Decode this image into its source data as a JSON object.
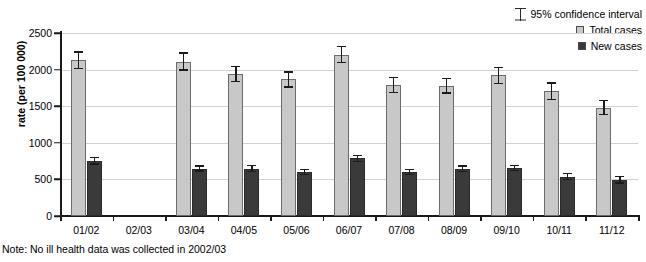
{
  "chart_data": {
    "type": "bar",
    "title": "",
    "xlabel": "",
    "ylabel": "rate (per 100 000)",
    "ylim": [
      0,
      2500
    ],
    "yticks": [
      0,
      500,
      1000,
      1500,
      2000,
      2500
    ],
    "grid": true,
    "legend_position": "top-right",
    "categories": [
      "01/02",
      "02/03",
      "03/04",
      "04/05",
      "05/06",
      "06/07",
      "07/08",
      "08/09",
      "09/10",
      "10/11",
      "11/12"
    ],
    "series": [
      {
        "name": "Total cases",
        "color": "#c8c8c8",
        "values": [
          2130,
          null,
          2110,
          1940,
          1865,
          2205,
          1790,
          1780,
          1920,
          1705,
          1480
        ],
        "ci_low": [
          2010,
          null,
          1985,
          1830,
          1755,
          2085,
          1680,
          1670,
          1800,
          1585,
          1375
        ],
        "ci_high": [
          2250,
          null,
          2235,
          2050,
          1975,
          2325,
          1900,
          1890,
          2040,
          1825,
          1585
        ]
      },
      {
        "name": "New cases",
        "color": "#3a3a3a",
        "values": [
          755,
          null,
          645,
          645,
          595,
          790,
          600,
          640,
          655,
          535,
          490
        ],
        "ci_low": [
          700,
          null,
          605,
          600,
          555,
          740,
          560,
          595,
          610,
          485,
          440
        ],
        "ci_high": [
          810,
          null,
          690,
          695,
          640,
          840,
          645,
          690,
          700,
          590,
          545
        ]
      }
    ],
    "error_bar_label": "95% confidence interval",
    "note": "Note: No ill health data was collected in 2002/03"
  },
  "legend": {
    "ci_label": "95% confidence interval",
    "items": [
      {
        "label": "Total cases",
        "color": "#c8c8c8"
      },
      {
        "label": "New cases",
        "color": "#3a3a3a"
      }
    ]
  },
  "axis": {
    "y_title": "rate (per 100 000)"
  },
  "footer": {
    "note": "Note: No ill health data was collected in 2002/03"
  }
}
